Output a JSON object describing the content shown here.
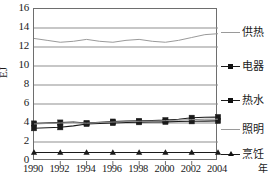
{
  "chart_data": {
    "type": "line",
    "title": "",
    "xlabel": "年",
    "ylabel": "EJ",
    "x": [
      1990,
      1991,
      1992,
      1993,
      1994,
      1995,
      1996,
      1997,
      1998,
      1999,
      2000,
      2001,
      2002,
      2003,
      2004
    ],
    "xlim": [
      1990,
      2004
    ],
    "ylim": [
      0,
      16
    ],
    "yticks": [
      0,
      2,
      4,
      6,
      8,
      10,
      12,
      14,
      16
    ],
    "xticks": [
      1990,
      1992,
      1994,
      1996,
      1998,
      2000,
      2002,
      2004
    ],
    "grid": true,
    "legend_position": "right",
    "series": [
      {
        "name": "供热",
        "marker": "none",
        "color": "#9a9a9a",
        "values": [
          12.9,
          12.7,
          12.5,
          12.6,
          12.8,
          12.6,
          12.5,
          12.7,
          12.8,
          12.6,
          12.5,
          12.7,
          13.0,
          13.3,
          13.4
        ]
      },
      {
        "name": "电器",
        "marker": "square",
        "color": "#1a1a1a",
        "values": [
          3.95,
          4.0,
          4.05,
          4.1,
          4.0,
          4.08,
          4.15,
          4.2,
          4.22,
          4.25,
          4.3,
          4.4,
          4.55,
          4.6,
          4.62
        ]
      },
      {
        "name": "热水",
        "marker": "square",
        "color": "#1a1a1a",
        "values": [
          3.45,
          3.5,
          3.55,
          3.7,
          3.9,
          3.95,
          4.0,
          4.05,
          4.08,
          4.1,
          4.12,
          4.15,
          4.18,
          4.2,
          4.22
        ]
      },
      {
        "name": "照明",
        "marker": "none",
        "color": "#8c8c8c",
        "values": [
          3.9,
          3.95,
          4.0,
          4.05,
          3.98,
          4.05,
          4.1,
          4.15,
          4.18,
          4.2,
          4.25,
          4.3,
          4.35,
          4.4,
          4.4
        ]
      },
      {
        "name": "烹饪",
        "marker": "triangle",
        "color": "#1a1a1a",
        "values": [
          0.9,
          0.9,
          0.9,
          0.9,
          0.9,
          0.9,
          0.9,
          0.9,
          0.9,
          0.9,
          0.9,
          0.9,
          0.9,
          0.9,
          0.9
        ]
      }
    ]
  },
  "axes": {
    "y_title": "EJ",
    "x_title": "年",
    "y_tick_labels": [
      "16",
      "14",
      "12",
      "10",
      "8",
      "6",
      "4",
      "2",
      "0"
    ],
    "x_tick_labels": [
      "1990",
      "1992",
      "1994",
      "1996",
      "1998",
      "2000",
      "2002",
      "2004"
    ]
  },
  "legend": {
    "entries": [
      {
        "label": "供热",
        "marker": "line-only"
      },
      {
        "label": "电器",
        "marker": "square"
      },
      {
        "label": "热水",
        "marker": "square"
      },
      {
        "label": "照明",
        "marker": "line-only"
      },
      {
        "label": "烹饪",
        "marker": "triangle"
      }
    ]
  },
  "colors": {
    "frame": "#6e6e6e",
    "gridline": "#8f8f8f",
    "dark_series": "#1a1a1a",
    "light_series": "#9a9a9a",
    "background": "#ffffff"
  }
}
